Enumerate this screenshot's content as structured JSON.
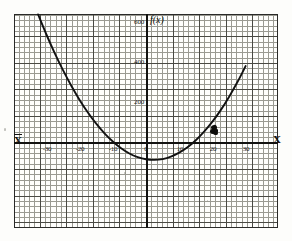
{
  "chart_data": {
    "type": "line",
    "title": "",
    "subtitle": "",
    "xlabel": "X",
    "ylabel": "f(x)",
    "xlim": [
      -34.5,
      31.5
    ],
    "ylim": [
      -265,
      700
    ],
    "grid": true,
    "grid_minor_step_x": 1,
    "grid_minor_step_y": 12.5,
    "grid_major_step_x": 5,
    "grid_major_step_y": 62.5,
    "legend": null,
    "xticks": [
      -30,
      -20,
      -10,
      0,
      10,
      20,
      30
    ],
    "xticklabels": [
      "-30",
      "-20",
      "-10",
      "0",
      "10",
      "20",
      "30"
    ],
    "yticks": [
      200,
      400,
      600
    ],
    "yticklabels": [
      "200",
      "400",
      "600"
    ],
    "series": [
      {
        "name": "f(x)",
        "style": "hand-drawn parabola",
        "color": "#111111",
        "x": [
          -32.5,
          -30,
          -27.5,
          -25,
          -22.5,
          -20,
          -17.5,
          -15,
          -12.5,
          -10,
          -7.5,
          -5,
          -2.5,
          0,
          2.5,
          5,
          7.5,
          10,
          12.5,
          15,
          17.5,
          20,
          22.5,
          25,
          27.5,
          30
        ],
        "y": [
          640,
          540,
          447,
          362,
          284,
          213,
          150,
          94,
          46,
          5,
          -29,
          -55,
          -73,
          -84,
          -87,
          -83,
          -71,
          -51,
          -24,
          11,
          54,
          104,
          162,
          228,
          301,
          382
        ]
      }
    ],
    "annotations": [
      {
        "name": "marked-point",
        "type": "point-marker",
        "x": 20.5,
        "y": 60,
        "label": ""
      }
    ]
  },
  "axes": {
    "x_label_left": "X",
    "x_label_right": "X",
    "y_label": "f(x)"
  },
  "ticks": {
    "x": [
      {
        "label": "-30",
        "px": 47
      },
      {
        "label": "-20",
        "px": 80
      },
      {
        "label": "-10",
        "px": 113
      },
      {
        "label": "0",
        "px": 146
      },
      {
        "label": "10",
        "px": 180
      },
      {
        "label": "20",
        "px": 213
      },
      {
        "label": "30",
        "px": 246
      }
    ],
    "y": [
      {
        "label": "600",
        "px": 22
      },
      {
        "label": "400",
        "px": 62
      },
      {
        "label": "200",
        "px": 102
      }
    ]
  }
}
